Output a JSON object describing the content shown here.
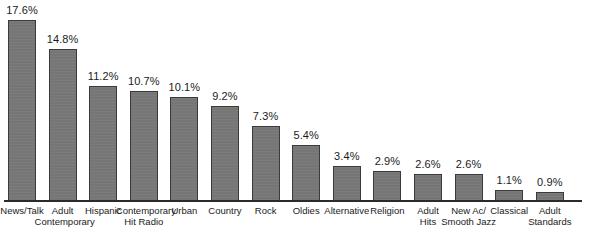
{
  "chart_data": {
    "type": "bar",
    "title": "",
    "xlabel": "",
    "ylabel": "",
    "ylim": [
      0,
      17.6
    ],
    "grid": false,
    "legend": null,
    "value_suffix": "%",
    "bar_color": "#767676",
    "bar_border_color": "#3a3a3a",
    "axis_color": "#2b2b2b",
    "background": "#ffffff",
    "categories": [
      "News/Talk",
      "Adult\nContemporary",
      "Hispanic",
      "Contemporary\nHit Radio",
      "Urban",
      "Country",
      "Rock",
      "Oldies",
      "Alternative",
      "Religion",
      "Adult\nHits",
      "New Ac/\nSmooth Jazz",
      "Classical",
      "Adult\nStandards"
    ],
    "values": [
      17.6,
      14.8,
      11.2,
      10.7,
      10.1,
      9.2,
      7.3,
      5.4,
      3.4,
      2.9,
      2.6,
      2.6,
      1.1,
      0.9
    ],
    "value_labels": [
      "17.6%",
      "14.8%",
      "11.2%",
      "10.7%",
      "10.1%",
      "9.2%",
      "7.3%",
      "5.4%",
      "3.4%",
      "2.9%",
      "2.6%",
      "2.6%",
      "1.1%",
      "0.9%"
    ]
  }
}
